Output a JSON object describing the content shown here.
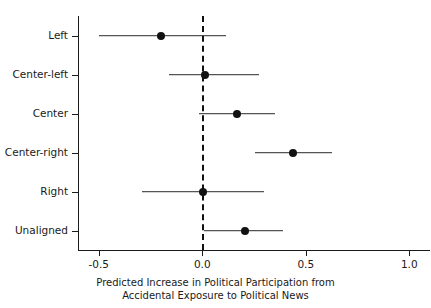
{
  "chart_data": {
    "type": "scatter",
    "plot_kind": "coefficient-forest-plot",
    "title": "",
    "xlabel_line1": "Predicted Increase in Political Participation from",
    "xlabel_line2": "Accidental Exposure to Political News",
    "ylabel": "",
    "categories": [
      "Left",
      "Center-left",
      "Center",
      "Center-right",
      "Right",
      "Unaligned"
    ],
    "values": [
      -0.2,
      0.015,
      0.17,
      0.44,
      0.005,
      0.205
    ],
    "ci_low": [
      -0.5,
      -0.16,
      -0.015,
      0.255,
      -0.29,
      0.01
    ],
    "ci_high": [
      0.115,
      0.275,
      0.35,
      0.625,
      0.3,
      0.39
    ],
    "xlim": [
      -0.6,
      1.1
    ],
    "xticks": [
      -0.5,
      0.0,
      0.5,
      1.0
    ],
    "xticklabels": [
      "-0.5",
      "0.0",
      "0.5",
      "1.0"
    ],
    "reference_line": 0.0,
    "reference_line_style": "dashed",
    "grid": false,
    "legend": "none",
    "point_color": "#111111",
    "line_color": "#2b2b2b",
    "axis_color": "#1a1a1a",
    "background": "#ffffff",
    "points": [
      {
        "category": "Left",
        "estimate": -0.2,
        "ci_low": -0.5,
        "ci_high": 0.115
      },
      {
        "category": "Center-left",
        "estimate": 0.015,
        "ci_low": -0.16,
        "ci_high": 0.275
      },
      {
        "category": "Center",
        "estimate": 0.17,
        "ci_low": -0.015,
        "ci_high": 0.35
      },
      {
        "category": "Center-right",
        "estimate": 0.44,
        "ci_low": 0.255,
        "ci_high": 0.625
      },
      {
        "category": "Right",
        "estimate": 0.005,
        "ci_low": -0.29,
        "ci_high": 0.3
      },
      {
        "category": "Unaligned",
        "estimate": 0.205,
        "ci_low": 0.01,
        "ci_high": 0.39
      }
    ]
  }
}
